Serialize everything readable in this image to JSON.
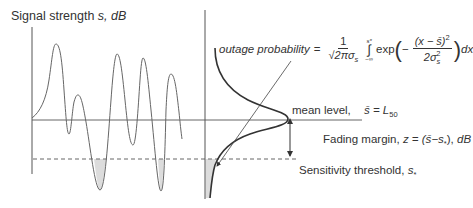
{
  "diagram": {
    "y_axis_label": "Signal strength s, dB",
    "y_axis_label_parts": {
      "text": "Signal strength ",
      "var": "s",
      "unit": ", dB"
    },
    "outage": {
      "label": "outage probability",
      "equals": "=",
      "numerator": "1",
      "denominator": "√2πσ",
      "denominator_sub": "s",
      "integral_upper": "s*",
      "integral_lower": "−∞",
      "integral_symbol": "∫",
      "exp": "exp",
      "inner_minus": "−",
      "inner_numerator": "(x − s̄)",
      "inner_numerator_sup": "2",
      "inner_denominator": "2σ",
      "inner_denominator_sub": "s",
      "inner_denominator_sup": "2",
      "dx": "dx"
    },
    "mean_level": {
      "label": "mean level,",
      "expr": "s̄ = L",
      "expr_sub": "50"
    },
    "fading_margin": {
      "label": "Fading margin,",
      "expr": "z = (s̄−s",
      "expr_sub": "*",
      "expr_end": "),",
      "unit": "dB"
    },
    "sensitivity_threshold": {
      "label": "Sensitivity threshold,",
      "var": "s",
      "var_sub": "*"
    },
    "colors": {
      "line": "#555555",
      "distribution": "#333333",
      "text": "#333333",
      "shade": "#bbbbbb",
      "background": "#ffffff"
    }
  }
}
